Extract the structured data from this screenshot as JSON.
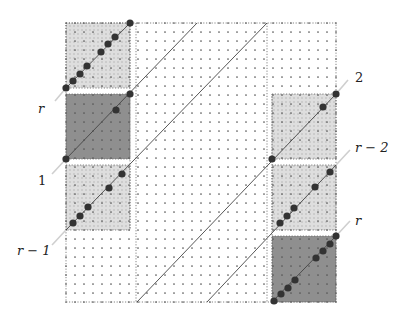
{
  "diagram": {
    "grid": {
      "x0": 66,
      "y0": 23,
      "x1": 336,
      "y1": 302,
      "step": 9
    },
    "colors": {
      "background": "#ffffff",
      "dot": "#555555",
      "border": "#666666",
      "light_block": "#dcdcdc",
      "dark_block": "#8f8f8f",
      "light_block_fill": "#d6d6d6",
      "line": "#444444",
      "guide": "#cfcfcf",
      "node": "#333333"
    },
    "left_column": {
      "x0": 66,
      "x1": 130
    },
    "right_column": {
      "x0": 272,
      "x1": 336
    },
    "center_region": {
      "x0": 136,
      "x1": 267
    },
    "blocks": [
      {
        "id": "left-top",
        "x": 66,
        "y": 23,
        "w": 64,
        "h": 65,
        "shade": "light"
      },
      {
        "id": "left-mid",
        "x": 66,
        "y": 94,
        "w": 64,
        "h": 65,
        "shade": "dark"
      },
      {
        "id": "left-low",
        "x": 66,
        "y": 165,
        "w": 64,
        "h": 65,
        "shade": "light"
      },
      {
        "id": "right-top",
        "x": 272,
        "y": 94,
        "w": 64,
        "h": 65,
        "shade": "light"
      },
      {
        "id": "right-mid",
        "x": 272,
        "y": 165,
        "w": 64,
        "h": 65,
        "shade": "light"
      },
      {
        "id": "right-low",
        "x": 272,
        "y": 236,
        "w": 64,
        "h": 66,
        "shade": "dark"
      }
    ],
    "diagonals": [
      {
        "x1": 66,
        "y1": 88,
        "x2": 130,
        "y2": 23
      },
      {
        "x1": 66,
        "y1": 159,
        "x2": 197,
        "y2": 23
      },
      {
        "x1": 66,
        "y1": 230,
        "x2": 267,
        "y2": 23
      },
      {
        "x1": 137,
        "y1": 302,
        "x2": 336,
        "y2": 94
      },
      {
        "x1": 207,
        "y1": 302,
        "x2": 336,
        "y2": 165
      },
      {
        "x1": 272,
        "y1": 302,
        "x2": 336,
        "y2": 236
      }
    ],
    "guides": [
      {
        "x1": 55,
        "y1": 101,
        "x2": 66,
        "y2": 88
      },
      {
        "x1": 52,
        "y1": 174,
        "x2": 66,
        "y2": 159
      },
      {
        "x1": 52,
        "y1": 245,
        "x2": 66,
        "y2": 230
      },
      {
        "x1": 336,
        "y1": 94,
        "x2": 348,
        "y2": 80
      },
      {
        "x1": 336,
        "y1": 165,
        "x2": 350,
        "y2": 150
      },
      {
        "x1": 336,
        "y1": 236,
        "x2": 350,
        "y2": 221
      }
    ],
    "nodes": [
      [
        66,
        88
      ],
      [
        73,
        81
      ],
      [
        80,
        74
      ],
      [
        87,
        66
      ],
      [
        101,
        52
      ],
      [
        108,
        44
      ],
      [
        115,
        37
      ],
      [
        130,
        23
      ],
      [
        66,
        159
      ],
      [
        116,
        110
      ],
      [
        130,
        94
      ],
      [
        73,
        223
      ],
      [
        80,
        216
      ],
      [
        88,
        207
      ],
      [
        109,
        188
      ],
      [
        122,
        174
      ],
      [
        272,
        159
      ],
      [
        323,
        107
      ],
      [
        336,
        94
      ],
      [
        280,
        223
      ],
      [
        287,
        216
      ],
      [
        294,
        208
      ],
      [
        315,
        187
      ],
      [
        330,
        172
      ],
      [
        274,
        301
      ],
      [
        281,
        294
      ],
      [
        288,
        288
      ],
      [
        295,
        280
      ],
      [
        316,
        258
      ],
      [
        323,
        251
      ],
      [
        330,
        244
      ],
      [
        336,
        236
      ]
    ],
    "labels": [
      {
        "id": "label-r-left",
        "text": "r",
        "x": 38,
        "y": 113,
        "italic": true
      },
      {
        "id": "label-1",
        "text": "1",
        "x": 38,
        "y": 185,
        "italic": false
      },
      {
        "id": "label-r-minus-1",
        "text": "r − 1",
        "x": 17,
        "y": 255,
        "italic": true
      },
      {
        "id": "label-2",
        "text": "2",
        "x": 355,
        "y": 82,
        "italic": false
      },
      {
        "id": "label-r-minus-2",
        "text": "r − 2",
        "x": 355,
        "y": 152,
        "italic": true
      },
      {
        "id": "label-r-right",
        "text": "r",
        "x": 355,
        "y": 225,
        "italic": true
      }
    ]
  }
}
